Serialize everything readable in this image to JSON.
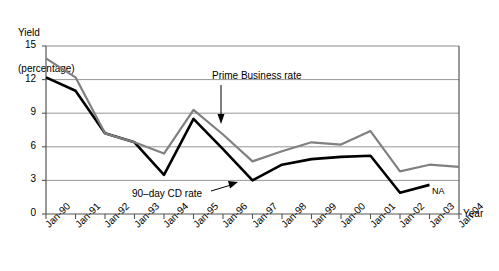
{
  "chart_data": {
    "type": "line",
    "title": "",
    "ylabel": "Yield\n(percentage)",
    "ylabel_line1": "Yield",
    "ylabel_line2": "(percentage)",
    "xlabel": "Year",
    "categories": [
      "Jan-90",
      "Jan-91",
      "Jan-92",
      "Jan-93",
      "Jan-94",
      "Jan-95",
      "Jan-96",
      "Jan-97",
      "Jan-98",
      "Jan-99",
      "Jan-00",
      "Jan-01",
      "Jan-02",
      "Jan-03",
      "Jan-04"
    ],
    "ylim": [
      0,
      15
    ],
    "yticks": [
      0,
      3,
      6,
      9,
      12,
      15
    ],
    "ytick_labels": [
      "0",
      "3",
      "6",
      "9",
      "12",
      "15"
    ],
    "grid": true,
    "legend_position": "annotations",
    "series": [
      {
        "name": "Prime Business rate",
        "color": "#808080",
        "values": [
          13.9,
          12.2,
          7.2,
          6.4,
          5.4,
          9.3,
          7.1,
          4.7,
          5.6,
          6.4,
          6.2,
          7.4,
          3.8,
          4.4,
          4.2
        ]
      },
      {
        "name": "90--day CD rate",
        "color": "#000000",
        "values": [
          12.2,
          11.0,
          7.2,
          6.4,
          3.5,
          8.5,
          5.8,
          3.0,
          4.4,
          4.9,
          5.1,
          5.2,
          1.9,
          2.6,
          null
        ]
      }
    ],
    "annotations": [
      {
        "text": "Prime Business rate",
        "kind": "arrow-down"
      },
      {
        "text": "90--day CD rate",
        "kind": "arrow-right"
      },
      {
        "text": "NA",
        "kind": "note"
      }
    ]
  },
  "labels": {
    "prime_annotation": "Prime Business rate",
    "cd_annotation": "90–day CD rate",
    "na_note": "NA",
    "year_axis": "Year",
    "yield_line1": "Yield",
    "yield_line2": "(percentage)"
  }
}
